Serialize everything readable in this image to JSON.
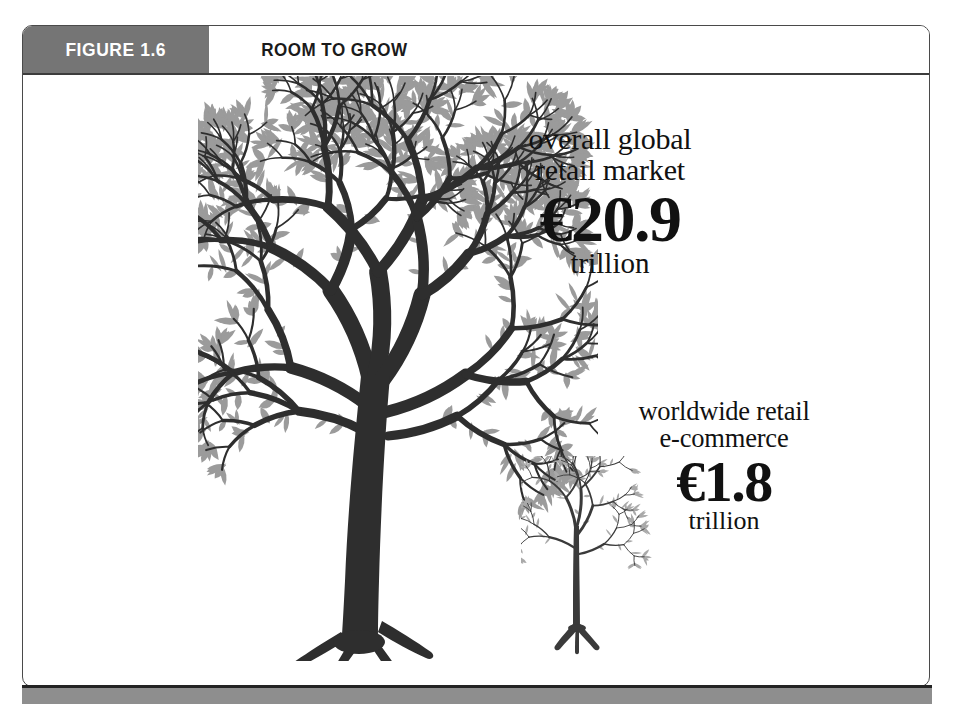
{
  "figure": {
    "number_label": "FIGURE 1.6",
    "title": "ROOM TO GROW"
  },
  "callouts": [
    {
      "id": "overall-global-retail-market",
      "caption_line1": "overall global",
      "caption_line2": "retail market",
      "amount": "€20.9",
      "unit": "trillion"
    },
    {
      "id": "worldwide-retail-ecommerce",
      "caption_line1": "worldwide retail",
      "caption_line2": "e-commerce",
      "amount": "€1.8",
      "unit": "trillion"
    }
  ],
  "chart_data": {
    "type": "bar",
    "title": "ROOM TO GROW",
    "subtitle": "FIGURE 1.6",
    "categories": [
      "overall global retail market",
      "worldwide retail e-commerce"
    ],
    "values": [
      20.9,
      1.8
    ],
    "value_labels": [
      "€20.9 trillion",
      "€1.8 trillion"
    ],
    "unit": "trillion",
    "currency": "EUR",
    "xlabel": "",
    "ylabel": "trillion EUR",
    "ylim": [
      0,
      22
    ],
    "grid": false,
    "legend": "none",
    "encoding": "pictorial: tree size proportional to market value",
    "glyphs": [
      "large-tree",
      "small-sapling"
    ]
  },
  "colors": {
    "header_block": "#757575",
    "header_text_on_block": "#ffffff",
    "title_text": "#1a1a1a",
    "frame_border": "#4a4a4a",
    "rule": "#3c3c3c",
    "bottom_bar": "#8e8e8e",
    "tree_branch": "#2e2e2e",
    "tree_leaf": "#9b9b9b",
    "sapling_branch": "#3a3a3a",
    "sapling_leaf": "#a9a9a9",
    "background": "#ffffff",
    "callout_text": "#111111"
  },
  "icons": {
    "large_tree": "tree-icon",
    "small_tree": "sapling-icon"
  }
}
